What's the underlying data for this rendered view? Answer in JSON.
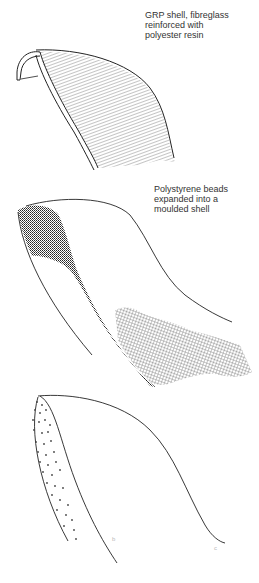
{
  "labels": {
    "grp_shell": {
      "lines": [
        "GRP shell, fibreglass",
        "reinforced with",
        "polyester resin"
      ]
    },
    "polystyrene_shell": {
      "lines": [
        "Polystyrene beads",
        "expanded into a",
        "moulded shell"
      ]
    }
  },
  "figure_marks": {
    "mark_b": "b",
    "mark_c": "c"
  },
  "colors": {
    "ink": "#222222",
    "text": "#333333",
    "background": "#ffffff"
  }
}
